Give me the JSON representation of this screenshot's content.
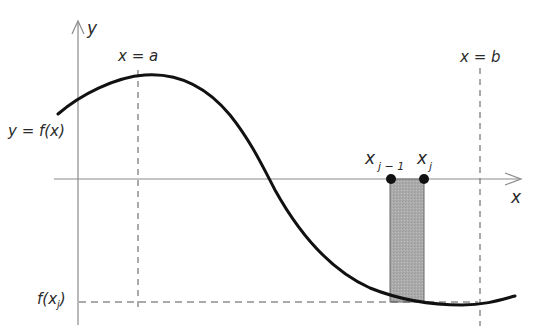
{
  "diagram": {
    "labels": {
      "y_axis": "y",
      "x_axis": "x",
      "x_equals_a": "x = a",
      "x_equals_b": "x = b",
      "curve": "y = f(x)",
      "x_j_minus_1_base": "x",
      "x_j_minus_1_sub": "j − 1",
      "x_j_base": "x",
      "x_j_sub": "j",
      "f_xj_prefix": "f(x",
      "f_xj_sub": "j",
      "f_xj_suffix": ")"
    },
    "colors": {
      "axis": "#8a8a8a",
      "curve": "#111111",
      "dashed": "#555555",
      "rectangle_fill": "#a9a9a9",
      "rectangle_stroke": "#555555",
      "points": "#111111"
    },
    "elements": [
      {
        "name": "y-axis",
        "type": "arrow-line"
      },
      {
        "name": "x-axis",
        "type": "arrow-line"
      },
      {
        "name": "curve-f",
        "type": "curve"
      },
      {
        "name": "line-x-equals-a",
        "type": "dashed-vertical"
      },
      {
        "name": "line-x-equals-b",
        "type": "dashed-vertical"
      },
      {
        "name": "line-f-xj",
        "type": "dashed-horizontal"
      },
      {
        "name": "rectangle-j",
        "type": "shaded-rectangle"
      },
      {
        "name": "point-x-j-minus-1",
        "type": "point"
      },
      {
        "name": "point-x-j",
        "type": "point"
      }
    ]
  }
}
